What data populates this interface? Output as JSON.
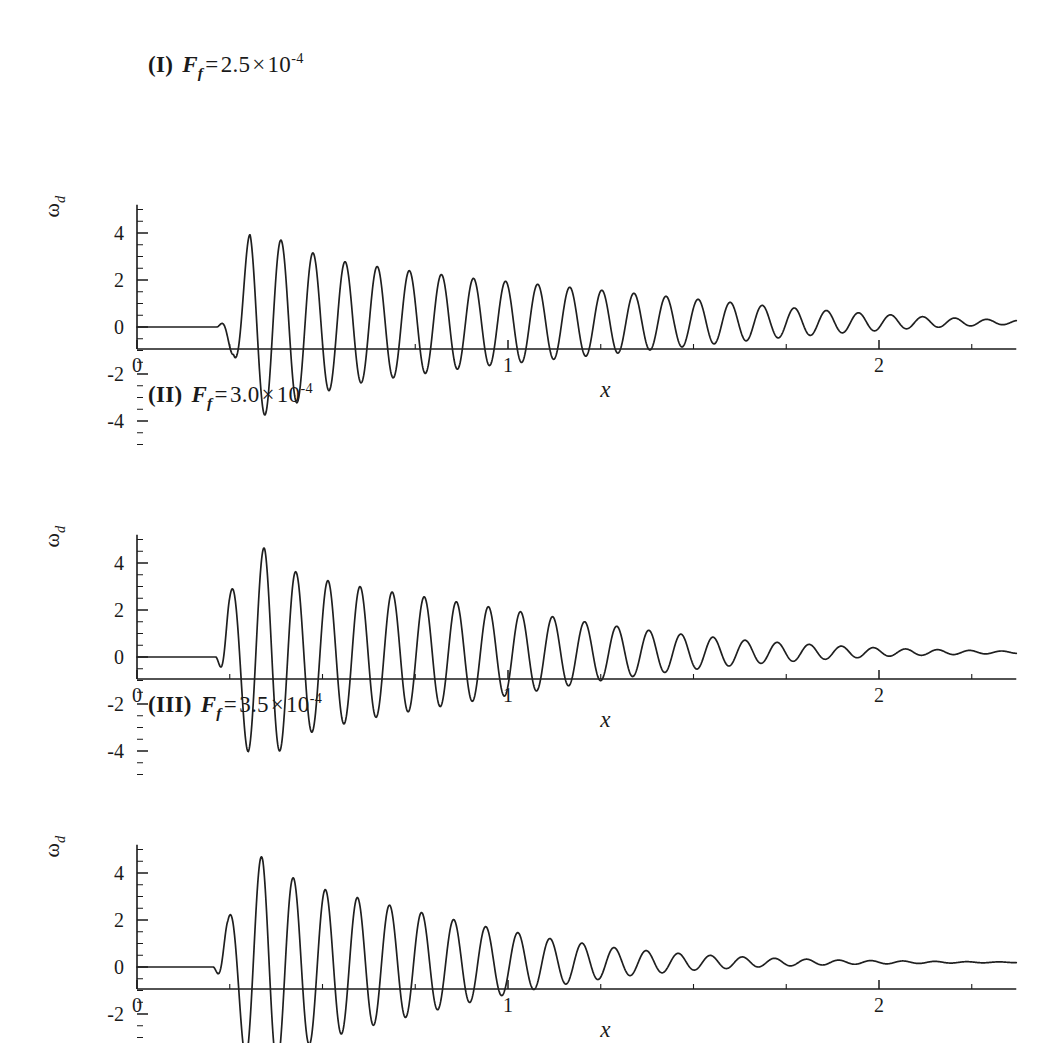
{
  "figure": {
    "background": "#ffffff",
    "line_color": "#1f1f1f",
    "axis_color": "#1a1a1a"
  },
  "panels": [
    {
      "id": "I",
      "roman": "(I)",
      "symbol": "F",
      "symbol_sub": "f",
      "equals": "=",
      "mantissa": "2.5",
      "times": "×",
      "base": "10",
      "exponent": "-4",
      "caption_plain": "(I)  F_f = 2.5 × 10^-4",
      "xlabel": "x",
      "ylabel_main": "ω",
      "ylabel_sub": "d"
    },
    {
      "id": "II",
      "roman": "(II)",
      "symbol": "F",
      "symbol_sub": "f",
      "equals": "=",
      "mantissa": "3.0",
      "times": "×",
      "base": "10",
      "exponent": "-4",
      "caption_plain": "(II)  F_f = 3.0 × 10^-4",
      "xlabel": "x",
      "ylabel_main": "ω",
      "ylabel_sub": "d"
    },
    {
      "id": "III",
      "roman": "(III)",
      "symbol": "F",
      "symbol_sub": "f",
      "equals": "=",
      "mantissa": "3.5",
      "times": "×",
      "base": "10",
      "exponent": "-4",
      "caption_plain": "(III)  F_f = 3.5 × 10^-4",
      "xlabel": "x",
      "ylabel_main": "ω",
      "ylabel_sub": "d"
    }
  ],
  "axis": {
    "x_ticks": [
      "0",
      "1",
      "2"
    ],
    "x_tick_values": [
      0,
      1,
      2
    ],
    "x_minor_step": 0.25,
    "y_ticks": [
      "4",
      "2",
      "0",
      "-2",
      "-4"
    ],
    "y_tick_values": [
      4,
      2,
      0,
      -2,
      -4
    ],
    "y_minor_step": 0.5,
    "xlim": [
      0,
      2.37
    ],
    "ylim": [
      -5.2,
      5.2
    ]
  },
  "chart_data": {
    "type": "line",
    "title": "",
    "xlabel": "x",
    "ylabel": "ω_d",
    "xlim": [
      0,
      2.37
    ],
    "ylim": [
      -5.2,
      5.2
    ],
    "grid": false,
    "legend": "none",
    "xticks": [
      0,
      1,
      2
    ],
    "yticks": [
      -4,
      -2,
      0,
      2,
      4
    ],
    "series": [
      {
        "name": "(I) F_f = 2.5e-4",
        "panel": "I",
        "onset_x": 0.215,
        "wavelength": 0.0865,
        "phase_deg": 90,
        "peak_amplitude": 4.0,
        "peak_x": 0.305,
        "envelope_rise_width": 0.055,
        "envelope_decay_length": 0.52,
        "tail_offset": 0.2,
        "first_bump_amplitude": 1.0,
        "min_value": -4.1,
        "max_value": 4.0,
        "envelope_markers": [
          {
            "x": 0.26,
            "amp": 1.2
          },
          {
            "x": 0.305,
            "amp": 4.0
          },
          {
            "x": 0.39,
            "amp": 3.6
          },
          {
            "x": 0.48,
            "amp": 3.0
          },
          {
            "x": 0.57,
            "amp": 2.6
          },
          {
            "x": 0.7,
            "amp": 2.3
          },
          {
            "x": 0.9,
            "amp": 1.9
          },
          {
            "x": 1.1,
            "amp": 1.6
          },
          {
            "x": 1.3,
            "amp": 1.3
          },
          {
            "x": 1.5,
            "amp": 1.0
          },
          {
            "x": 1.7,
            "amp": 0.7
          },
          {
            "x": 1.9,
            "amp": 0.45
          },
          {
            "x": 2.1,
            "amp": 0.25
          },
          {
            "x": 2.3,
            "amp": 0.12
          }
        ]
      },
      {
        "name": "(II) F_f = 3.0e-4",
        "panel": "II",
        "onset_x": 0.212,
        "wavelength": 0.0865,
        "phase_deg": 270,
        "peak_amplitude": 4.1,
        "peak_x": 0.3,
        "envelope_rise_width": 0.05,
        "envelope_decay_length": 0.44,
        "tail_offset": 0.2,
        "first_bump_amplitude": 2.6,
        "min_value": -4.6,
        "max_value": 4.1,
        "envelope_markers": [
          {
            "x": 0.25,
            "amp": 2.7
          },
          {
            "x": 0.3,
            "amp": 4.1
          },
          {
            "x": 0.345,
            "amp": 4.6
          },
          {
            "x": 0.43,
            "amp": 3.5
          },
          {
            "x": 0.52,
            "amp": 3.1
          },
          {
            "x": 0.65,
            "amp": 2.7
          },
          {
            "x": 0.85,
            "amp": 2.2
          },
          {
            "x": 1.05,
            "amp": 1.7
          },
          {
            "x": 1.25,
            "amp": 1.2
          },
          {
            "x": 1.45,
            "amp": 0.8
          },
          {
            "x": 1.65,
            "amp": 0.5
          },
          {
            "x": 1.85,
            "amp": 0.3
          },
          {
            "x": 2.05,
            "amp": 0.15
          },
          {
            "x": 2.25,
            "amp": 0.08
          }
        ]
      },
      {
        "name": "(III) F_f = 3.5e-4",
        "panel": "III",
        "onset_x": 0.205,
        "wavelength": 0.0865,
        "phase_deg": 270,
        "peak_amplitude": 4.0,
        "peak_x": 0.295,
        "envelope_rise_width": 0.045,
        "envelope_decay_length": 0.36,
        "tail_offset": 0.2,
        "first_bump_amplitude": 2.0,
        "min_value": -4.7,
        "max_value": 4.0,
        "envelope_markers": [
          {
            "x": 0.245,
            "amp": 2.0
          },
          {
            "x": 0.295,
            "amp": 4.0
          },
          {
            "x": 0.34,
            "amp": 4.7
          },
          {
            "x": 0.42,
            "amp": 3.7
          },
          {
            "x": 0.5,
            "amp": 3.2
          },
          {
            "x": 0.62,
            "amp": 2.7
          },
          {
            "x": 0.78,
            "amp": 2.1
          },
          {
            "x": 0.95,
            "amp": 1.5
          },
          {
            "x": 1.12,
            "amp": 1.0
          },
          {
            "x": 1.3,
            "amp": 0.6
          },
          {
            "x": 1.5,
            "amp": 0.33
          },
          {
            "x": 1.7,
            "amp": 0.18
          },
          {
            "x": 1.9,
            "amp": 0.09
          },
          {
            "x": 2.1,
            "amp": 0.05
          }
        ]
      }
    ]
  }
}
